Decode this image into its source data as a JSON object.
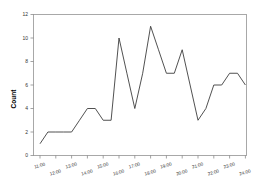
{
  "chart_data": {
    "type": "line",
    "title": "",
    "subtitle": "",
    "xlabel": "",
    "ylabel": "Count",
    "ylim": [
      0,
      12
    ],
    "yticks": [
      0,
      2,
      4,
      6,
      8,
      10,
      12
    ],
    "ytick_labels": [
      "0",
      "2",
      "4",
      "6",
      "8",
      "10",
      "12"
    ],
    "grid": false,
    "legend": false,
    "legend_position": "none",
    "xtick_labels": [
      "11:00",
      "12:00",
      "13:00",
      "14:00",
      "15:00",
      "16:00",
      "17:00",
      "18:00",
      "19:00",
      "20:00",
      "21:00",
      "22:00",
      "23:00",
      "24:00"
    ],
    "x": [
      "11:00",
      "11:30",
      "12:00",
      "12:30",
      "13:00",
      "13:30",
      "14:00",
      "14:30",
      "15:00",
      "15:30",
      "16:00",
      "16:30",
      "17:00",
      "17:30",
      "18:00",
      "18:30",
      "19:00",
      "19:30",
      "20:00",
      "20:30",
      "21:00",
      "21:30",
      "22:00",
      "22:30",
      "23:00",
      "23:30",
      "24:00"
    ],
    "values": [
      1,
      2,
      2,
      2,
      2,
      3,
      4,
      4,
      3,
      3,
      10,
      7,
      4,
      7,
      11,
      9,
      7,
      7,
      9,
      6,
      3,
      4,
      6,
      6,
      7,
      7,
      6
    ],
    "series": [
      {
        "name": "Count",
        "color": "#3d3d3d",
        "values": [
          1,
          2,
          2,
          2,
          2,
          3,
          4,
          4,
          3,
          3,
          10,
          7,
          4,
          7,
          11,
          9,
          7,
          7,
          9,
          6,
          3,
          4,
          6,
          6,
          7,
          7,
          6
        ]
      }
    ],
    "annotations": []
  },
  "colors": {
    "line": "#3d3d3d",
    "frame": "#a8a8a8",
    "tick": "#7d7d7d",
    "text": "#333333",
    "axis_label": "#000000",
    "background": "#ffffff"
  }
}
